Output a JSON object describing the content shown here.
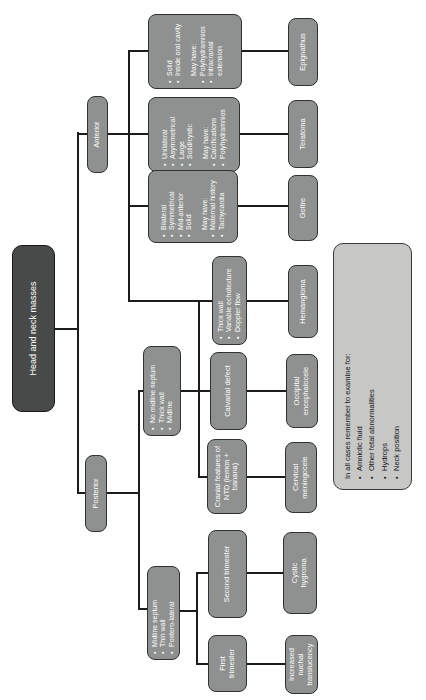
{
  "figure": {
    "bullet_char": "•",
    "colors": {
      "node_fill": "#8f9190",
      "node_border": "#303232",
      "root_fill": "#484a4a",
      "note_fill": "#c7c8c6",
      "line": "#1c1c1c",
      "text_light": "#fdfdfd",
      "text_dark": "#161616"
    },
    "nodes": {
      "root": {
        "label": "Head and neck masses"
      },
      "anterior": {
        "label": "Anterior"
      },
      "posterior": {
        "label": "Posterior"
      },
      "epignathus_features": {
        "bullets": [
          "Solid",
          "Inside oral cavity"
        ],
        "may_have_heading": "May have:",
        "may_have": [
          "Polyhydramnios",
          "Intracranial extension"
        ]
      },
      "teratoma_features": {
        "bullets": [
          "Unilateral",
          "Asymmetrical",
          "Large",
          "Solid/cystic"
        ],
        "may_have_heading": "May have:",
        "may_have": [
          "Calcifications",
          "Polyhydramnios"
        ]
      },
      "goitre_features": {
        "bullets": [
          "Bilateral",
          "Symmetrical",
          "Mid-anterior",
          "Solid"
        ],
        "may_have_heading": "May have:",
        "may_have": [
          "Maternal history",
          "Tachycardia"
        ]
      },
      "hemangioma_features": {
        "bullets": [
          "Thick wall",
          "Variable echotexture",
          "Doppler flow"
        ]
      },
      "posterior_midline_features": {
        "bullets": [
          "No midline septum",
          "Thick wall",
          "Midline"
        ]
      },
      "posterior_lateral_features": {
        "bullets": [
          "Midline septum",
          "Thin wall",
          "Postero-lateral"
        ]
      },
      "calvarial_defect": {
        "label": "Calvarial defect"
      },
      "cranial_ntd": {
        "label": "Cranial features of NTD (lemon + banana)"
      },
      "second_trimester": {
        "label": "Second trimester"
      },
      "first_trimester": {
        "label": "First trimester"
      },
      "epignathus": {
        "label": "Epignathus"
      },
      "teratoma": {
        "label": "Teratoma"
      },
      "goitre": {
        "label": "Goitre"
      },
      "hemangioma": {
        "label": "Hemangioma"
      },
      "occipital_encephalocele": {
        "label": "Occipital encephalocele"
      },
      "cervical_meningocele": {
        "label": "Cervical meningocele"
      },
      "cystic_hygroma": {
        "label": "Cystic hygroma"
      },
      "increased_nuchal_translucency": {
        "label": "Increased nuchal translucency"
      }
    },
    "note": {
      "heading": "In all cases remember to examine for:",
      "bullets": [
        "Amniotic fluid",
        "Other fetal abnormalities",
        "Hydrops",
        "Neck position"
      ]
    }
  }
}
